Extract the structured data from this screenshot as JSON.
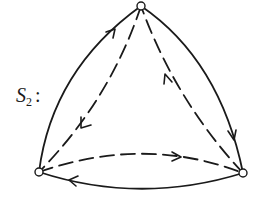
{
  "diagram": {
    "label": {
      "base": "S",
      "subscript": "2",
      "suffix": ":"
    },
    "colors": {
      "stroke": "#1a1a1a",
      "vertex_fill": "#ffffff"
    },
    "vertices": [
      {
        "id": "top",
        "x": 141,
        "y": 6
      },
      {
        "id": "bottom-left",
        "x": 39,
        "y": 172
      },
      {
        "id": "bottom-right",
        "x": 243,
        "y": 173
      }
    ],
    "edges": [
      {
        "id": "left-outer",
        "from": "bottom-left",
        "to": "top",
        "style": "solid",
        "arrow": "toward top"
      },
      {
        "id": "left-inner",
        "from": "top",
        "to": "bottom-left",
        "style": "dashed",
        "arrow": "toward bottom-left"
      },
      {
        "id": "right-inner",
        "from": "bottom-right",
        "to": "top",
        "style": "dashed",
        "arrow": "toward top"
      },
      {
        "id": "right-outer",
        "from": "top",
        "to": "bottom-right",
        "style": "solid",
        "arrow": "toward bottom-right"
      },
      {
        "id": "bottom-inner",
        "from": "bottom-left",
        "to": "bottom-right",
        "style": "dashed",
        "arrow": "toward bottom-right"
      },
      {
        "id": "bottom-outer",
        "from": "bottom-right",
        "to": "bottom-left",
        "style": "solid",
        "arrow": "toward bottom-left"
      }
    ]
  }
}
